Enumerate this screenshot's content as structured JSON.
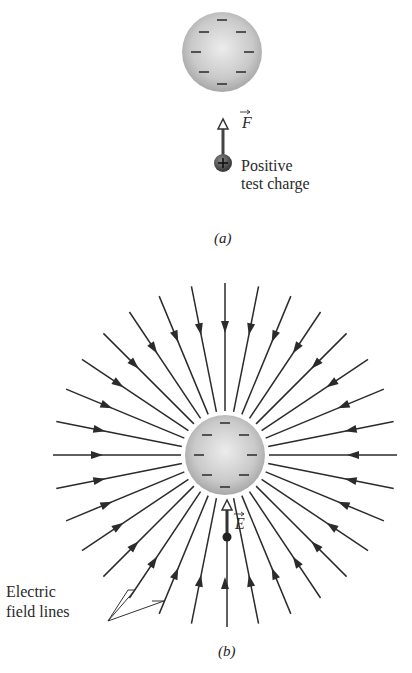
{
  "panel_a": {
    "caption": "(a)",
    "sphere": {
      "charge": "negative",
      "minus_signs": 8
    },
    "force_label": "F",
    "test_charge_label_line1": "Positive",
    "test_charge_label_line2": "test charge",
    "test_charge_sign": "+"
  },
  "panel_b": {
    "caption": "(b)",
    "sphere": {
      "charge": "negative",
      "minus_signs": 8
    },
    "field_label": "E",
    "field_lines_count": 32,
    "field_lines_direction": "inward",
    "annotation_line1": "Electric",
    "annotation_line2": "field lines"
  },
  "colors": {
    "line": "#2b2b2b",
    "sphere_light": "#e8e8e8",
    "sphere_dark": "#a9a9a9"
  }
}
